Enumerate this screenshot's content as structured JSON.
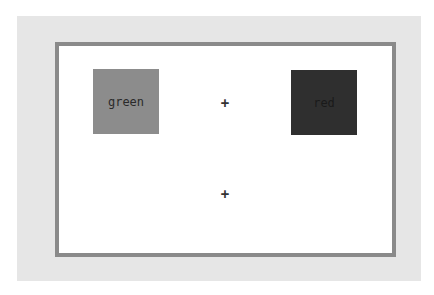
{
  "boxes": [
    {
      "label": "green",
      "color": "#8c8c8c"
    },
    {
      "label": "red",
      "color": "#2f2f2f"
    }
  ],
  "markers": [
    {
      "symbol": "+"
    },
    {
      "symbol": "+"
    }
  ]
}
